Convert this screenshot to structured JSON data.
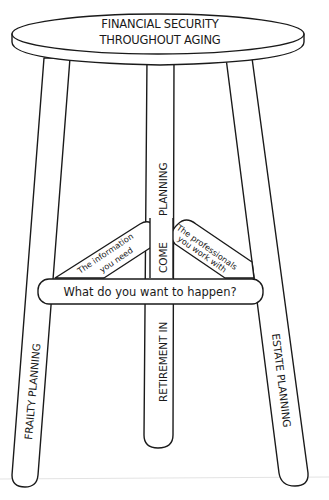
{
  "diagram": {
    "type": "three-legged-stool",
    "seat": {
      "line1": "FINANCIAL SECURITY",
      "line2": "THROUGHOUT AGING"
    },
    "legs": {
      "left": "FRAILTY PLANNING",
      "center_top": "PLANNING",
      "center_mid": "COME",
      "center_bottom": "RETIREMENT  IN",
      "right": "ESTATE PLANNING"
    },
    "braces": {
      "left_line1": "The information",
      "left_line2": "you need",
      "right_line1": "The professionals",
      "right_line2": "you work with"
    },
    "crossbar": "What do you want to happen?",
    "colors": {
      "ink": "#1a1a1a",
      "background": "#ffffff"
    }
  }
}
